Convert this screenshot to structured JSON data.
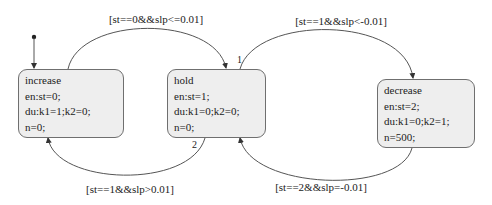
{
  "states": [
    {
      "id": "increase",
      "name": "increase",
      "entry": "en:st=0;",
      "during": "du:k1=1;k2=0;",
      "extra": "n=0;"
    },
    {
      "id": "hold",
      "name": "hold",
      "entry": "en:st=1;",
      "during": "du:k1=0;k2=0;",
      "extra": "n=0;"
    },
    {
      "id": "decrease",
      "name": "decrease",
      "entry": "en:st=2;",
      "during": "du:k1=0;k2=1;",
      "extra": "n=500;"
    }
  ],
  "transitions": [
    {
      "from": "increase",
      "to": "hold",
      "condition": "[st==0&&slp<=0.01]"
    },
    {
      "from": "hold",
      "to": "decrease",
      "condition": "[st==1&&slp<-0.01]",
      "order": "1"
    },
    {
      "from": "hold",
      "to": "increase",
      "condition": "[st==1&&slp>0.01]",
      "order": "2"
    },
    {
      "from": "decrease",
      "to": "hold",
      "condition": "[st==2&&slp=-0.01]"
    }
  ],
  "colors": {
    "state_fill": "#eeeeee",
    "state_border": "#6f6f6f",
    "wire": "#555555"
  }
}
